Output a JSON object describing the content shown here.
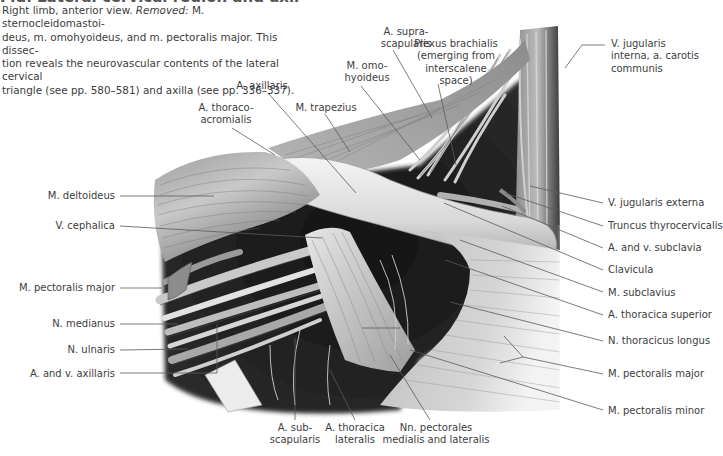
{
  "caption": {
    "heading_partial": "Fig. Lateral cervical region and axilla",
    "text_lead": "Right limb, anterior view. ",
    "removed_label": "Removed:",
    "text_rest": " M. sternocleidomastoi-deus, m. omohyoideus, and m. pectoralis major. This dissec-tion reveals the neurovascular contents of the lateral cervical triangle (see pp. 580–581) and axilla (see pp. 336–337).",
    "lines": [
      "Right limb, anterior view. |Removed:| M. sternocleidomastoi-",
      "deus, m. omohyoideus, and m. pectoralis major. This dissec-",
      "tion reveals the neurovascular contents of the lateral cervical",
      "triangle (see pp. 580–581) and axilla (see pp. 336–337)."
    ]
  },
  "labels": {
    "top": [
      {
        "id": "a-suprascapularis",
        "text": [
          "A. supra-",
          "scapularis"
        ],
        "x": 406,
        "y": 26,
        "align": "center"
      },
      {
        "id": "plexus-brachialis",
        "text": [
          "Plexus brachialis",
          "(emerging from",
          "interscalene",
          "space)"
        ],
        "x": 456,
        "y": 38,
        "align": "center"
      },
      {
        "id": "m-omohyoideus",
        "text": [
          "M. omo-",
          "hyoideus"
        ],
        "x": 367,
        "y": 60,
        "align": "center"
      },
      {
        "id": "a-axillaris",
        "text": [
          "A. axillaris"
        ],
        "x": 262,
        "y": 80,
        "align": "center"
      },
      {
        "id": "a-thoracoacromialis",
        "text": [
          "A. thoraco-",
          "acromialis"
        ],
        "x": 226,
        "y": 102,
        "align": "center"
      },
      {
        "id": "m-trapezius",
        "text": [
          "M. trapezius"
        ],
        "x": 326,
        "y": 102,
        "align": "center"
      },
      {
        "id": "v-jugularis-interna",
        "text": [
          "V. jugularis",
          "interna, a. carotis",
          "communis"
        ],
        "x": 611,
        "y": 38,
        "align": "left"
      }
    ],
    "left": [
      {
        "id": "m-deltoideus",
        "text": [
          "M. deltoideus"
        ],
        "x": 115,
        "y": 190,
        "align": "right"
      },
      {
        "id": "v-cephalica",
        "text": [
          "V. cephalica"
        ],
        "x": 115,
        "y": 220,
        "align": "right"
      },
      {
        "id": "m-pectoralis-major-left",
        "text": [
          "M. pectoralis major"
        ],
        "x": 115,
        "y": 282,
        "align": "right"
      },
      {
        "id": "n-medianus",
        "text": [
          "N. medianus"
        ],
        "x": 115,
        "y": 318,
        "align": "right"
      },
      {
        "id": "n-ulnaris",
        "text": [
          "N. ulnaris"
        ],
        "x": 115,
        "y": 344,
        "align": "right"
      },
      {
        "id": "a-v-axillaris",
        "text": [
          "A. and v. axillaris"
        ],
        "x": 115,
        "y": 368,
        "align": "right"
      }
    ],
    "right": [
      {
        "id": "v-jugularis-externa",
        "text": [
          "V. jugularis externa"
        ],
        "x": 608,
        "y": 197,
        "align": "left"
      },
      {
        "id": "truncus-thyrocervicalis",
        "text": [
          "Truncus thyrocervicalis"
        ],
        "x": 608,
        "y": 220,
        "align": "left"
      },
      {
        "id": "a-v-subclavia",
        "text": [
          "A. and v. subclavia"
        ],
        "x": 608,
        "y": 242,
        "align": "left"
      },
      {
        "id": "clavicula",
        "text": [
          "Clavicula"
        ],
        "x": 608,
        "y": 264,
        "align": "left"
      },
      {
        "id": "m-subclavius",
        "text": [
          "M. subclavius"
        ],
        "x": 608,
        "y": 287,
        "align": "left"
      },
      {
        "id": "a-thoracica-superior",
        "text": [
          "A. thoracica superior"
        ],
        "x": 608,
        "y": 309,
        "align": "left"
      },
      {
        "id": "n-thoracicus-longus",
        "text": [
          "N. thoracicus longus"
        ],
        "x": 608,
        "y": 335,
        "align": "left"
      },
      {
        "id": "m-pectoralis-major-right",
        "text": [
          "M. pectoralis major"
        ],
        "x": 608,
        "y": 368,
        "align": "left"
      },
      {
        "id": "m-pectoralis-minor",
        "text": [
          "M. pectoralis minor"
        ],
        "x": 608,
        "y": 405,
        "align": "left"
      }
    ],
    "bottom": [
      {
        "id": "a-subscapularis",
        "text": [
          "A. sub-",
          "scapularis"
        ],
        "x": 295,
        "y": 422,
        "align": "center"
      },
      {
        "id": "a-thoracica-lateralis",
        "text": [
          "A. thoracica",
          "lateralis"
        ],
        "x": 355,
        "y": 422,
        "align": "center"
      },
      {
        "id": "nn-pectorales",
        "text": [
          "Nn. pectorales",
          "medialis and lateralis"
        ],
        "x": 436,
        "y": 422,
        "align": "center"
      }
    ]
  },
  "leaders": [
    {
      "id": "a-suprascapularis",
      "pts": [
        [
          393,
          50
        ],
        [
          432,
          118
        ]
      ]
    },
    {
      "id": "plexus-brachialis",
      "pts": [
        [
          438,
          84
        ],
        [
          456,
          165
        ]
      ]
    },
    {
      "id": "m-omohyoideus",
      "pts": [
        [
          361,
          86
        ],
        [
          420,
          160
        ]
      ]
    },
    {
      "id": "a-axillaris",
      "pts": [
        [
          268,
          93
        ],
        [
          356,
          193
        ]
      ]
    },
    {
      "id": "a-thoracoacromialis",
      "pts": [
        [
          232,
          128
        ],
        [
          275,
          155
        ]
      ]
    },
    {
      "id": "m-trapezius",
      "pts": [
        [
          325,
          114
        ],
        [
          350,
          152
        ]
      ]
    },
    {
      "id": "v-jugularis-interna",
      "pts": [
        [
          605,
          45
        ],
        [
          582,
          45
        ],
        [
          565,
          68
        ]
      ]
    },
    {
      "id": "m-deltoideus",
      "pts": [
        [
          120,
          196
        ],
        [
          214,
          196
        ]
      ]
    },
    {
      "id": "v-cephalica",
      "pts": [
        [
          120,
          226
        ],
        [
          322,
          238
        ]
      ]
    },
    {
      "id": "m-pectoralis-major-left",
      "pts": [
        [
          120,
          288
        ],
        [
          162,
          288
        ]
      ]
    },
    {
      "id": "n-medianus",
      "pts": [
        [
          120,
          324
        ],
        [
          178,
          324
        ]
      ]
    },
    {
      "id": "n-ulnaris",
      "pts": [
        [
          120,
          350
        ],
        [
          188,
          349
        ]
      ]
    },
    {
      "id": "a-v-axillaris",
      "pts": [
        [
          120,
          373
        ],
        [
          217,
          373
        ],
        [
          217,
          324
        ]
      ]
    },
    {
      "id": "v-jugularis-externa",
      "pts": [
        [
          603,
          203
        ],
        [
          530,
          186
        ]
      ]
    },
    {
      "id": "truncus-thyrocervicalis",
      "pts": [
        [
          603,
          226
        ],
        [
          505,
          193
        ]
      ]
    },
    {
      "id": "a-v-subclavia",
      "pts": [
        [
          603,
          248
        ],
        [
          502,
          206
        ]
      ]
    },
    {
      "id": "clavicula",
      "pts": [
        [
          603,
          270
        ],
        [
          444,
          203
        ]
      ]
    },
    {
      "id": "m-subclavius",
      "pts": [
        [
          603,
          292
        ],
        [
          460,
          240
        ]
      ]
    },
    {
      "id": "a-thoracica-superior",
      "pts": [
        [
          603,
          315
        ],
        [
          445,
          260
        ]
      ]
    },
    {
      "id": "n-thoracicus-longus",
      "pts": [
        [
          603,
          341
        ],
        [
          450,
          302
        ]
      ]
    },
    {
      "id": "m-pectoralis-major-right",
      "pts": [
        [
          603,
          374
        ],
        [
          523,
          357
        ],
        [
          504,
          336
        ]
      ]
    },
    {
      "id": "m-pectoralis-minor",
      "pts": [
        [
          603,
          410
        ],
        [
          410,
          350
        ]
      ]
    },
    {
      "id": "a-subscapularis",
      "pts": [
        [
          295,
          420
        ],
        [
          295,
          338
        ]
      ]
    },
    {
      "id": "a-thoracica-lateralis",
      "pts": [
        [
          355,
          420
        ],
        [
          330,
          370
        ]
      ]
    },
    {
      "id": "nn-pectorales",
      "pts": [
        [
          430,
          420
        ],
        [
          390,
          355
        ]
      ]
    }
  ],
  "extra_leaders": [
    {
      "for": "m-pectoralis-major-right",
      "pts": [
        [
          523,
          357
        ],
        [
          500,
          363
        ]
      ]
    },
    {
      "for": "m-pectoralis-minor",
      "pts": [
        [
          362,
          328
        ],
        [
          400,
          328
        ]
      ]
    }
  ],
  "colors": {
    "text": "#3d3d3d",
    "leader": "#5a5a5a",
    "muscle_light": "#d9d9d9",
    "muscle_mid": "#a6a6a6",
    "shadow": "#111111",
    "bone": "#ececec"
  }
}
